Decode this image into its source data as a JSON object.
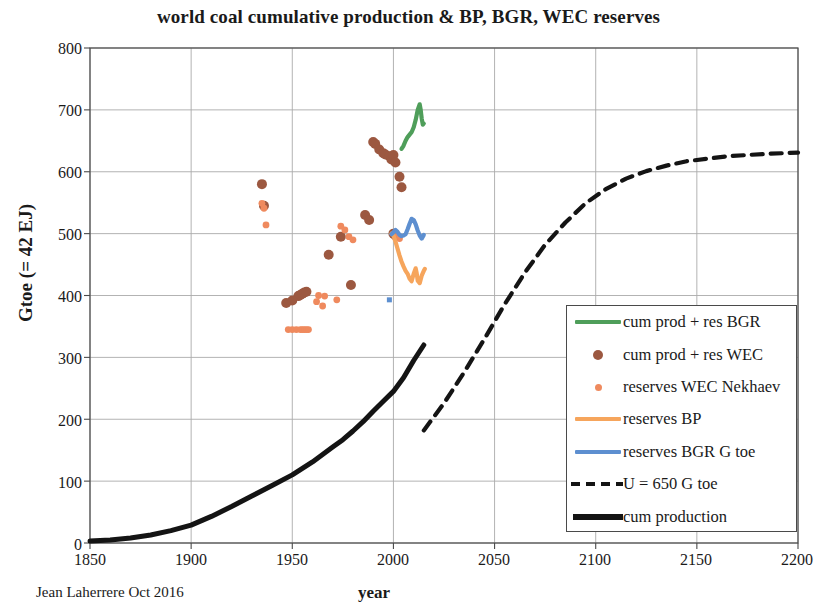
{
  "chart_data": {
    "type": "scatter",
    "title": "world coal cumulative production & BP, BGR, WEC reserves",
    "xlabel": "year",
    "ylabel": "Gtoe (= 42 EJ)",
    "credit": "Jean Laherrere Oct 2016",
    "xlim": [
      1850,
      2200
    ],
    "ylim": [
      0,
      800
    ],
    "xticks": [
      "1850",
      "1900",
      "1950",
      "2000",
      "2050",
      "2100",
      "2150",
      "2200"
    ],
    "yticks": [
      "0",
      "100",
      "200",
      "300",
      "400",
      "500",
      "600",
      "700",
      "800"
    ],
    "xtick_step": 50,
    "ytick_step": 100,
    "grid": true,
    "legend_position": "center right",
    "colors": {
      "bgr_cum": "#4f9e5a",
      "wec_cum": "#9c5840",
      "wec_nekhaev": "#ef8a5e",
      "bp_reserves": "#f6a55c",
      "bgr_reserves": "#5d8fd0",
      "ultimate_dashed": "#141414",
      "cum_production": "#141414",
      "grid": "#aaaaaa",
      "axis": "#4a4a4a"
    },
    "series": [
      {
        "name": "cum prod + res BGR",
        "legend_label": "cum prod + res BGR",
        "style": "line",
        "color": "#4f9e5a",
        "points": [
          [
            2004,
            637
          ],
          [
            2005,
            642
          ],
          [
            2006,
            650
          ],
          [
            2007,
            656
          ],
          [
            2008,
            660
          ],
          [
            2009,
            664
          ],
          [
            2010,
            672
          ],
          [
            2011,
            684
          ],
          [
            2012,
            700
          ],
          [
            2013,
            709
          ],
          [
            2013.5,
            700
          ],
          [
            2014,
            686
          ],
          [
            2014.5,
            676
          ],
          [
            2015,
            678
          ]
        ]
      },
      {
        "name": "cum prod + res WEC",
        "legend_label": "cum prod + res WEC",
        "style": "dots",
        "color": "#9c5840",
        "points": [
          [
            1935,
            580
          ],
          [
            1936,
            545
          ],
          [
            1990,
            648
          ],
          [
            1991,
            645
          ],
          [
            1993,
            636
          ],
          [
            1995,
            630
          ],
          [
            1996,
            628
          ],
          [
            1998,
            625
          ],
          [
            1999,
            620
          ],
          [
            2000,
            627
          ],
          [
            2001,
            615
          ],
          [
            2003,
            592
          ],
          [
            2004,
            575
          ],
          [
            1968,
            466
          ],
          [
            1974,
            495
          ],
          [
            1986,
            530
          ],
          [
            1988,
            522
          ],
          [
            1979,
            417
          ],
          [
            1947,
            388
          ],
          [
            1950,
            392
          ],
          [
            1953,
            399
          ],
          [
            1954,
            401
          ],
          [
            1955,
            403
          ],
          [
            1956,
            405
          ],
          [
            1957,
            406
          ],
          [
            2000,
            500
          ],
          [
            2001,
            497
          ]
        ]
      },
      {
        "name": "reserves WEC Nekhaev",
        "legend_label": "reserves WEC Nekhaev",
        "style": "small-dots",
        "color": "#ef8a5e",
        "points": [
          [
            1935,
            549
          ],
          [
            1936,
            541
          ],
          [
            1937,
            514
          ],
          [
            1974,
            512
          ],
          [
            1976,
            506
          ],
          [
            1978,
            495
          ],
          [
            1980,
            490
          ],
          [
            1963,
            400
          ],
          [
            1966,
            399
          ],
          [
            1972,
            393
          ],
          [
            1948,
            345
          ],
          [
            1950,
            345
          ],
          [
            1952,
            345
          ],
          [
            1954,
            345
          ],
          [
            1955,
            345
          ],
          [
            1956,
            345
          ],
          [
            1957,
            345
          ],
          [
            1958,
            345
          ],
          [
            1962,
            390
          ],
          [
            1965,
            383
          ],
          [
            2002,
            496
          ],
          [
            2003,
            492
          ]
        ]
      },
      {
        "name": "reserves BP",
        "legend_label": "reserves BP",
        "style": "line",
        "color": "#f6a55c",
        "points": [
          [
            1999,
            500
          ],
          [
            2000,
            497
          ],
          [
            2001,
            487
          ],
          [
            2002,
            476
          ],
          [
            2003,
            465
          ],
          [
            2004,
            455
          ],
          [
            2005,
            447
          ],
          [
            2006,
            440
          ],
          [
            2007,
            435
          ],
          [
            2008,
            427
          ],
          [
            2009,
            423
          ],
          [
            2010,
            435
          ],
          [
            2011,
            444
          ],
          [
            2011.5,
            436
          ],
          [
            2012,
            424
          ],
          [
            2013,
            420
          ],
          [
            2014,
            432
          ],
          [
            2015,
            440
          ],
          [
            2015.5,
            443
          ]
        ]
      },
      {
        "name": "reserves BGR G toe",
        "legend_label": "reserves BGR G toe",
        "style": "line",
        "color": "#5d8fd0",
        "points": [
          [
            1999,
            499
          ],
          [
            2000,
            502
          ],
          [
            2001,
            506
          ],
          [
            2002,
            503
          ],
          [
            2003,
            498
          ],
          [
            2004,
            496
          ],
          [
            2005,
            497
          ],
          [
            2006,
            499
          ],
          [
            2007,
            507
          ],
          [
            2008,
            516
          ],
          [
            2009,
            524
          ],
          [
            2010,
            522
          ],
          [
            2011,
            515
          ],
          [
            2012,
            505
          ],
          [
            2013,
            497
          ],
          [
            2014,
            492
          ],
          [
            2015,
            498
          ]
        ]
      },
      {
        "name": "U = 650 G toe",
        "legend_label": "U = 650 G toe",
        "style": "dashed",
        "color": "#141414",
        "points": [
          [
            2015,
            182
          ],
          [
            2025,
            226
          ],
          [
            2035,
            276
          ],
          [
            2045,
            330
          ],
          [
            2055,
            386
          ],
          [
            2065,
            437
          ],
          [
            2075,
            482
          ],
          [
            2085,
            518
          ],
          [
            2095,
            549
          ],
          [
            2105,
            572
          ],
          [
            2115,
            589
          ],
          [
            2125,
            601
          ],
          [
            2135,
            610
          ],
          [
            2145,
            617
          ],
          [
            2155,
            621
          ],
          [
            2165,
            625
          ],
          [
            2175,
            627
          ],
          [
            2185,
            629
          ],
          [
            2200,
            631
          ]
        ]
      },
      {
        "name": "cum production",
        "legend_label": "cum production",
        "style": "thick-line",
        "color": "#141414",
        "points": [
          [
            1850,
            3
          ],
          [
            1860,
            5
          ],
          [
            1870,
            8
          ],
          [
            1880,
            13
          ],
          [
            1890,
            20
          ],
          [
            1900,
            29
          ],
          [
            1910,
            43
          ],
          [
            1920,
            59
          ],
          [
            1930,
            76
          ],
          [
            1940,
            93
          ],
          [
            1950,
            110
          ],
          [
            1960,
            131
          ],
          [
            1965,
            143
          ],
          [
            1970,
            155
          ],
          [
            1975,
            167
          ],
          [
            1980,
            181
          ],
          [
            1985,
            196
          ],
          [
            1990,
            213
          ],
          [
            1995,
            229
          ],
          [
            2000,
            245
          ],
          [
            2005,
            267
          ],
          [
            2010,
            295
          ],
          [
            2015,
            320
          ]
        ]
      }
    ]
  },
  "legend": {
    "items": [
      {
        "label": "cum prod + res BGR",
        "style": "line",
        "color": "#4f9e5a"
      },
      {
        "label": "cum prod + res WEC",
        "style": "dot",
        "color": "#9c5840"
      },
      {
        "label": "reserves WEC Nekhaev",
        "style": "small-dot",
        "color": "#ef8a5e"
      },
      {
        "label": "reserves BP",
        "style": "line",
        "color": "#f6a55c"
      },
      {
        "label": "reserves BGR G toe",
        "style": "line",
        "color": "#5d8fd0"
      },
      {
        "label": "U = 650 G toe",
        "style": "dashed",
        "color": "#141414"
      },
      {
        "label": "cum production",
        "style": "thick-line",
        "color": "#141414"
      }
    ]
  }
}
